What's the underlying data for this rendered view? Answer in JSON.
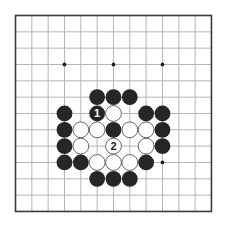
{
  "board": {
    "size": 13,
    "origin_x": 15.5,
    "origin_y": 15.5,
    "spacing": 16.33,
    "stone_radius": 7.9,
    "colors": {
      "background": "#ffffff",
      "grid_line": "#b5b5b5",
      "border": "#3a3a3a",
      "black_stone": "#262626",
      "white_stone": "#ffffff",
      "white_stone_outline": "#555555",
      "star_point": "#222222"
    },
    "star_points": [
      {
        "col": 3,
        "row": 3
      },
      {
        "col": 6,
        "row": 3
      },
      {
        "col": 9,
        "row": 3
      },
      {
        "col": 9,
        "row": 9
      }
    ],
    "stones": [
      {
        "color": "black",
        "col": 5,
        "row": 5
      },
      {
        "color": "black",
        "col": 6,
        "row": 5
      },
      {
        "color": "black",
        "col": 7,
        "row": 5
      },
      {
        "color": "black",
        "col": 3,
        "row": 6
      },
      {
        "color": "black",
        "col": 5,
        "row": 6,
        "label": "1"
      },
      {
        "color": "white",
        "col": 6,
        "row": 6
      },
      {
        "color": "black",
        "col": 8,
        "row": 6
      },
      {
        "color": "black",
        "col": 9,
        "row": 6
      },
      {
        "color": "black",
        "col": 3,
        "row": 7
      },
      {
        "color": "white",
        "col": 4,
        "row": 7
      },
      {
        "color": "white",
        "col": 5,
        "row": 7
      },
      {
        "color": "black",
        "col": 6,
        "row": 7
      },
      {
        "color": "white",
        "col": 7,
        "row": 7
      },
      {
        "color": "white",
        "col": 8,
        "row": 7
      },
      {
        "color": "black",
        "col": 9,
        "row": 7
      },
      {
        "color": "black",
        "col": 3,
        "row": 8
      },
      {
        "color": "white",
        "col": 4,
        "row": 8
      },
      {
        "color": "white",
        "col": 6,
        "row": 8,
        "label": "2"
      },
      {
        "color": "white",
        "col": 8,
        "row": 8
      },
      {
        "color": "black",
        "col": 9,
        "row": 8
      },
      {
        "color": "black",
        "col": 3,
        "row": 9
      },
      {
        "color": "black",
        "col": 4,
        "row": 9
      },
      {
        "color": "white",
        "col": 5,
        "row": 9
      },
      {
        "color": "white",
        "col": 6,
        "row": 9
      },
      {
        "color": "white",
        "col": 7,
        "row": 9
      },
      {
        "color": "black",
        "col": 8,
        "row": 9
      },
      {
        "color": "black",
        "col": 5,
        "row": 10
      },
      {
        "color": "black",
        "col": 6,
        "row": 10
      },
      {
        "color": "black",
        "col": 7,
        "row": 10
      }
    ],
    "move_labels": [
      {
        "number": "1",
        "color": "black"
      },
      {
        "number": "2",
        "color": "white"
      }
    ]
  }
}
